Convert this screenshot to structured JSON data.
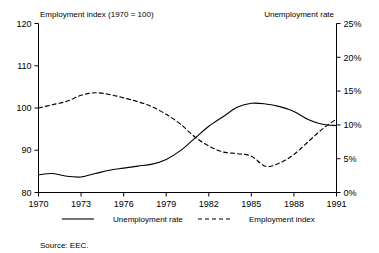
{
  "chart_data": {
    "type": "line",
    "title": "",
    "subtitle": "",
    "xlabel": "",
    "ylabel": "Employment index (1970 = 100)",
    "y2label": "Unemployment rate",
    "grid": false,
    "legend_position": "bottom",
    "xlim": [
      1970,
      1991
    ],
    "ylim": [
      80,
      120
    ],
    "y2lim": [
      0,
      25
    ],
    "xticks": [
      1970,
      1973,
      1976,
      1979,
      1982,
      1985,
      1988,
      1991
    ],
    "xticklabels": [
      "1970",
      "1973",
      "1976",
      "1979",
      "1982",
      "1985",
      "1988",
      "1991"
    ],
    "yticks": [
      80,
      90,
      100,
      110,
      120
    ],
    "yticklabels": [
      "80",
      "90",
      "100",
      "110",
      "120"
    ],
    "y2ticks": [
      0,
      5,
      10,
      15,
      20,
      25
    ],
    "y2ticklabels": [
      "0%",
      "5%",
      "10%",
      "15%",
      "20%",
      "25%"
    ],
    "x": [
      1970,
      1971,
      1972,
      1973,
      1974,
      1975,
      1976,
      1977,
      1978,
      1979,
      1980,
      1981,
      1982,
      1983,
      1984,
      1985,
      1986,
      1987,
      1988,
      1989,
      1990,
      1991
    ],
    "series": [
      {
        "name": "Unemployment rate",
        "axis": "right",
        "style": "solid",
        "color": "#000000",
        "unit": "%",
        "values": [
          2.6,
          2.8,
          2.4,
          2.3,
          2.8,
          3.3,
          3.6,
          3.9,
          4.2,
          4.9,
          6.2,
          8.0,
          9.8,
          11.2,
          12.6,
          13.2,
          13.1,
          12.7,
          12.0,
          10.8,
          10.1,
          9.9
        ]
      },
      {
        "name": "Employment index",
        "axis": "left",
        "style": "dashed",
        "color": "#000000",
        "unit": "index",
        "values": [
          100.0,
          100.8,
          101.6,
          103.0,
          103.6,
          103.2,
          102.4,
          101.5,
          100.3,
          98.5,
          96.2,
          93.2,
          91.0,
          89.6,
          89.2,
          88.6,
          86.2,
          87.0,
          89.0,
          92.0,
          95.0,
          97.4
        ]
      }
    ],
    "legend": [
      {
        "label": "Unemployment rate",
        "style": "solid"
      },
      {
        "label": "Employment index",
        "style": "dashed"
      }
    ],
    "source": "Source: EEC."
  }
}
